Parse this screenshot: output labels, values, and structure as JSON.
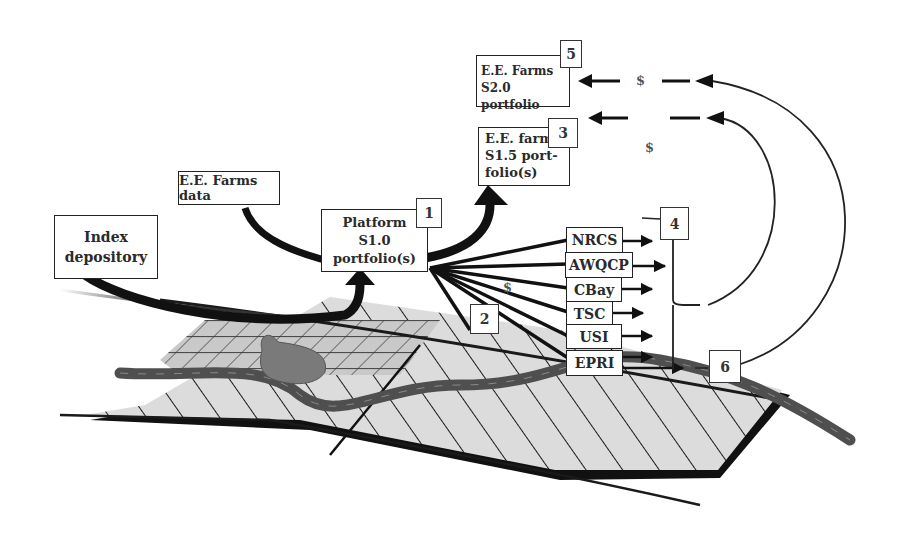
{
  "diagram": {
    "boxes": {
      "ee_farms_s20": {
        "line1": "E.E. Farms",
        "line2": "S2.0 portfolio",
        "number": "5"
      },
      "ee_farm_s15": {
        "line1": "E.E. farm",
        "line2": "S1.5 port-",
        "line3": "folio(s)",
        "number": "3"
      },
      "ee_farms_data": {
        "label": "E.E. Farms data"
      },
      "index_depository": {
        "line1": "Index",
        "line2": "depository"
      },
      "platform": {
        "line1": "Platform",
        "line2": "S1.0 portfolio(s)",
        "number": "1"
      }
    },
    "organizations": [
      "NRCS",
      "AWQCP",
      "CBay",
      "TSC",
      "USI",
      "EPRI"
    ],
    "number_labels": {
      "two": "2",
      "four": "4",
      "six": "6"
    },
    "flows": {
      "dollar_top": "$",
      "dollar_mid": "$",
      "dollar_platform": "$"
    },
    "colors": {
      "ink": "#1a1a1a",
      "field_fill": "#d9d9d9",
      "grid_fill": "#c8c8c8",
      "river": "#555555",
      "pond": "#7a7a7a"
    }
  }
}
